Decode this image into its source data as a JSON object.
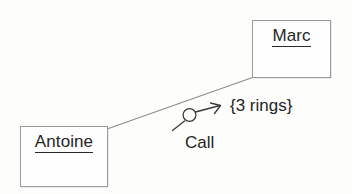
{
  "diagram": {
    "type": "uml-collaboration-diagram",
    "objects": [
      {
        "id": "marc",
        "name": "Marc",
        "underlined": true
      },
      {
        "id": "antoine",
        "name": "Antoine",
        "underlined": true
      }
    ],
    "link": {
      "from": "antoine",
      "to": "marc",
      "style": "solid-line",
      "color": "#8c8c8c"
    },
    "message": {
      "label": "Call",
      "constraint": "{3 rings}",
      "direction": "antoine-to-marc",
      "arrow_symbol": "circle-with-arrow"
    },
    "colors": {
      "background": "#fdfdfc",
      "box_border": "#9a9a9a",
      "box_fill": "#fefefe",
      "text": "#242424",
      "link_line": "#8c8c8c",
      "arrow": "#2f2f2f"
    }
  }
}
